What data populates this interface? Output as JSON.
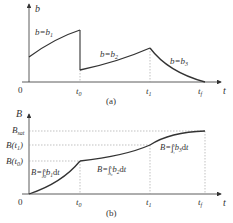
{
  "panel_a": {
    "caption": "(a)",
    "y_axis_label": "b",
    "x_axis_label": "t",
    "origin_label": "0",
    "x_ticks": [
      "t0",
      "t1",
      "tf"
    ],
    "segments": [
      {
        "label": "b=b1",
        "sub": "1"
      },
      {
        "label": "b=b2",
        "sub": "2"
      },
      {
        "label": "b=b3",
        "sub": "3"
      }
    ]
  },
  "panel_b": {
    "caption": "(b)",
    "y_axis_label": "B",
    "x_axis_label": "t",
    "origin_label": "0",
    "x_ticks": [
      "t0",
      "t1",
      "tf"
    ],
    "y_ticks": [
      "Bsat",
      "B(t1)",
      "B(t0)"
    ],
    "segments": [
      {
        "label": "B=∫₀^t₀ b1 dt"
      },
      {
        "label": "B=∫t₀^t₁ b2 dt"
      },
      {
        "label": "B=∫t₁^tf b3 dt"
      }
    ]
  },
  "colors": {
    "curve": "#333333",
    "axis": "#333333",
    "guide": "#999999"
  }
}
